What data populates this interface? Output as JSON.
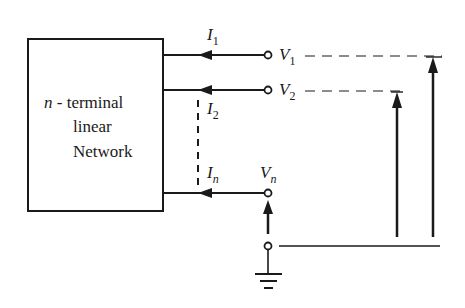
{
  "diagram": {
    "network_box": {
      "line1_var": "n",
      "line1_rest": " - terminal",
      "line2": "linear",
      "line3": "Network"
    },
    "currents": [
      {
        "symbol": "I",
        "sub": "1"
      },
      {
        "symbol": "I",
        "sub": "2"
      },
      {
        "symbol": "I",
        "sub": "n"
      }
    ],
    "voltages": [
      {
        "symbol": "V",
        "sub": "1"
      },
      {
        "symbol": "V",
        "sub": "2"
      },
      {
        "symbol": "V",
        "sub": "n"
      }
    ],
    "ground": "ground-reference",
    "colors": {
      "ink": "#1a1a1a",
      "background": "#ffffff"
    }
  }
}
